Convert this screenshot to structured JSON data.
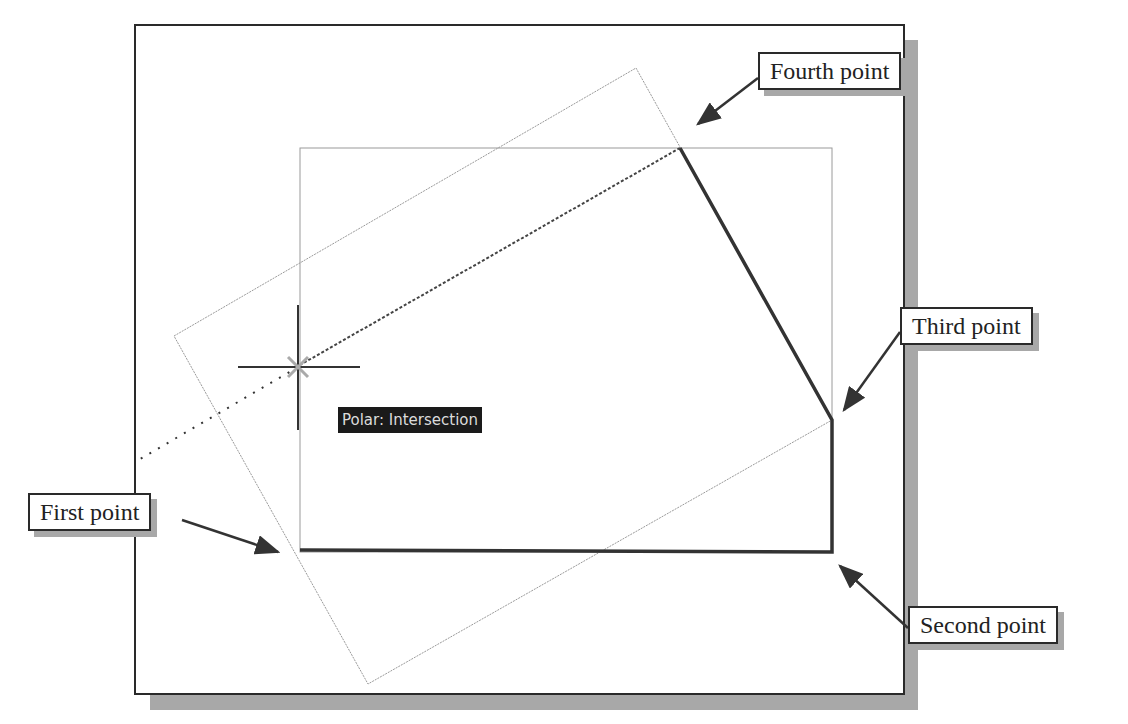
{
  "diagram": {
    "tooltip": "Polar: Intersection",
    "callouts": {
      "first": "First point",
      "second": "Second point",
      "third": "Third point",
      "fourth": "Fourth point"
    },
    "colors": {
      "frame": "#2a2a2a",
      "shadow": "#a8a8a8",
      "polyline": "#333333",
      "construction": "#9a9a9a",
      "tooltip_bg": "#1a1a1a",
      "tooltip_text": "#dcdcdc"
    },
    "points": {
      "first": [
        300,
        550
      ],
      "second": [
        832,
        552
      ],
      "third": [
        832,
        420
      ],
      "fourth": [
        680,
        148
      ],
      "cursor": [
        298,
        367
      ]
    }
  }
}
